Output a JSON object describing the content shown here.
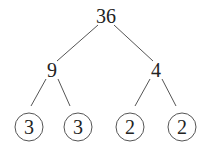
{
  "diagram": {
    "type": "factor-tree",
    "root": "36",
    "level1": [
      "9",
      "4"
    ],
    "leaves": [
      "3",
      "3",
      "2",
      "2"
    ],
    "leaves_circled": true
  }
}
